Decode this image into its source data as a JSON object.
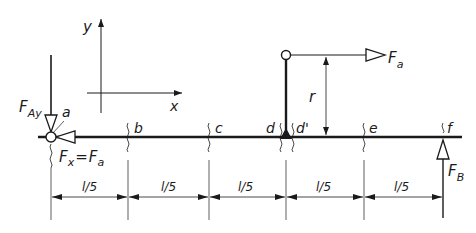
{
  "diagram": {
    "type": "beam free-body diagram",
    "colors": {
      "line": "#1a1a1a",
      "background": "#ffffff"
    },
    "axes": {
      "x_label": "x",
      "y_label": "y"
    },
    "points": [
      {
        "id": "a",
        "label": "a"
      },
      {
        "id": "b",
        "label": "b"
      },
      {
        "id": "c",
        "label": "c"
      },
      {
        "id": "d",
        "label": "d"
      },
      {
        "id": "d_prime",
        "label": "d'"
      },
      {
        "id": "e",
        "label": "e"
      },
      {
        "id": "f",
        "label": "f"
      }
    ],
    "forces": {
      "F_Ay": {
        "main": "F",
        "sub": "Ay"
      },
      "F_x": {
        "main": "F",
        "sub": "x",
        "eq": "=",
        "main2": "F",
        "sub2": "a"
      },
      "F_a": {
        "main": "F",
        "sub": "a"
      },
      "F_B": {
        "main": "F",
        "sub": "B"
      }
    },
    "lever": {
      "label": "r"
    },
    "dimensions": [
      "l/5",
      "l/5",
      "l/5",
      "l/5",
      "l/5"
    ]
  }
}
